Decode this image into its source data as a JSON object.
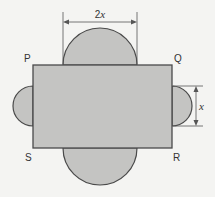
{
  "diagram": {
    "type": "composite-shape",
    "colors": {
      "fill": "#c4c4c2",
      "stroke": "#4a4a4a",
      "background": "#f4f4f2"
    },
    "vertices": {
      "top_left": "P",
      "top_right": "Q",
      "bottom_right": "R",
      "bottom_left": "S"
    },
    "dimensions": {
      "top_semicircle_diameter": "2x",
      "right_semicircle_diameter": "x"
    }
  }
}
